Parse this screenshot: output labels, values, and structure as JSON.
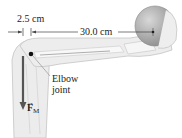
{
  "diagram": {
    "dimension_short": "2.5 cm",
    "dimension_long": "30.0 cm",
    "elbow_label_line1": "Elbow",
    "elbow_label_line2": "joint",
    "force_label": "F",
    "force_subscript": "M",
    "colors": {
      "arm": "#ececec",
      "arm_outline": "#bdbdbd",
      "bone": "#f7f7f7",
      "ball": "#b0b0b0",
      "arrow": "#555555",
      "text": "#222222"
    }
  }
}
